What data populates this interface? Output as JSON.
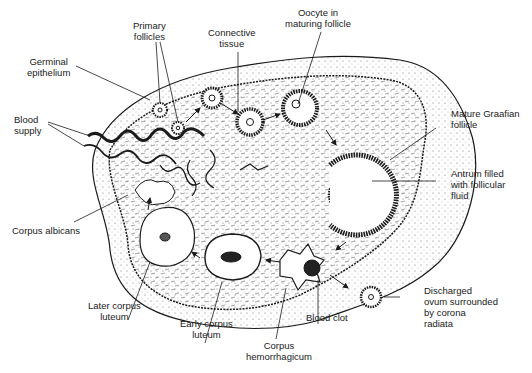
{
  "diagram": {
    "ink_color": "#1a1a1a",
    "background": "#ffffff",
    "labels": {
      "primary_follicles": "Primary\nfollicles",
      "connective_tissue": "Connective\ntissue",
      "oocyte_maturing": "Oocyte in\nmaturing follicle",
      "germinal_epithelium": "Germinal\nepithelium",
      "blood_supply": "Blood\nsupply",
      "mature_graafian": "Mature Graafian\nfollicle",
      "antrum": "Antrum filled\nwith follicular\nfluid",
      "corpus_albicans": "Corpus albicans",
      "discharged_ovum": "Discharged\novum surrounded\nby corona\nradiata",
      "later_corpus_luteum": "Later corpus\nluteum",
      "early_corpus_luteum": "Early corpus\nluteum",
      "blood_clot": "Blood clot",
      "corpus_hemorrhagicum": "Corpus\nhemorrhagicum"
    }
  }
}
